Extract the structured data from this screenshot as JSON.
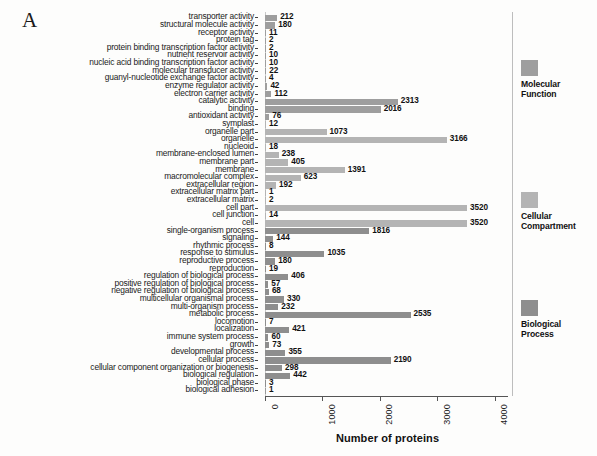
{
  "figure": {
    "panel_letter": "A",
    "axis_title": "Number of proteins"
  },
  "legend": [
    {
      "label": "Molecular\nFunction",
      "color": "#9e9e9e",
      "top": 60
    },
    {
      "label": "Cellular\nCompartment",
      "color": "#b4b4b4",
      "top": 192
    },
    {
      "label": "Biological\nProcess",
      "color": "#8e8e8e",
      "top": 300
    }
  ],
  "chart_data": {
    "type": "bar",
    "orientation": "horizontal",
    "title": "",
    "xlabel": "Number of proteins",
    "ylabel": "",
    "xlim": [
      0,
      4300
    ],
    "xticks": [
      0,
      1000,
      2000,
      3000,
      4000
    ],
    "xtick_labels": [
      "0",
      "1000",
      "2000",
      "3000",
      "4000"
    ],
    "grid": false,
    "legend_position": "right",
    "categories": [
      "transporter activity",
      "structural molecule activity",
      "receptor activity",
      "protein tag",
      "protein binding transcription factor activity",
      "nutrient reservoir activity",
      "nucleic acid binding transcription factor activity",
      "molecular transducer activity",
      "guanyl-nucleotide exchange factor activity",
      "enzyme regulator activity",
      "electron carrier activity",
      "catalytic activity",
      "binding",
      "antioxidant activity",
      "symplast",
      "organelle part",
      "organelle",
      "nucleoid",
      "membrane-enclosed lumen",
      "membrane part",
      "membrane",
      "macromolecular complex",
      "extracellular region",
      "extracellular matrix part",
      "extracellular matrix",
      "cell part",
      "cell junction",
      "cell",
      "single-organism process",
      "signaling",
      "rhythmic process",
      "response to stimulus",
      "reproductive process",
      "reproduction",
      "regulation of biological process",
      "positive regulation of biological process",
      "negative regulation of biological process",
      "multicellular organismal process",
      "multi-organism process",
      "metabolic process",
      "locomotion",
      "localization",
      "immune system process",
      "growth",
      "developmental process",
      "cellular process",
      "cellular component organization or biogenesis",
      "biological regulation",
      "biological phase",
      "biological adhesion"
    ],
    "values": [
      212,
      180,
      11,
      2,
      2,
      10,
      10,
      22,
      4,
      42,
      112,
      2313,
      2016,
      76,
      12,
      1073,
      3166,
      18,
      238,
      405,
      1391,
      623,
      192,
      1,
      2,
      3520,
      14,
      3520,
      1816,
      144,
      8,
      1035,
      180,
      19,
      406,
      57,
      68,
      330,
      232,
      2535,
      7,
      421,
      60,
      73,
      355,
      2190,
      298,
      442,
      3,
      1
    ],
    "groups": [
      "mf",
      "mf",
      "mf",
      "mf",
      "mf",
      "mf",
      "mf",
      "mf",
      "mf",
      "mf",
      "mf",
      "mf",
      "mf",
      "mf",
      "cc",
      "cc",
      "cc",
      "cc",
      "cc",
      "cc",
      "cc",
      "cc",
      "cc",
      "cc",
      "cc",
      "cc",
      "cc",
      "cc",
      "bp",
      "bp",
      "bp",
      "bp",
      "bp",
      "bp",
      "bp",
      "bp",
      "bp",
      "bp",
      "bp",
      "bp",
      "bp",
      "bp",
      "bp",
      "bp",
      "bp",
      "bp",
      "bp",
      "bp",
      "bp"
    ],
    "group_names": {
      "mf": "Molecular Function",
      "cc": "Cellular Compartment",
      "bp": "Biological Process"
    }
  }
}
